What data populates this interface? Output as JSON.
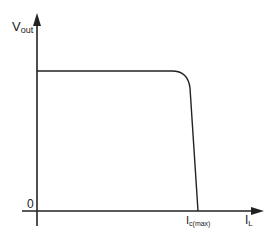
{
  "diagram": {
    "y_axis_label": {
      "main": "V",
      "sub": "out"
    },
    "x_axis_label": {
      "main": "I",
      "sub": "L"
    },
    "origin_label": "0",
    "x_tick_label": {
      "main": "I",
      "sub": "c(max)"
    },
    "line_color": "#222222"
  }
}
